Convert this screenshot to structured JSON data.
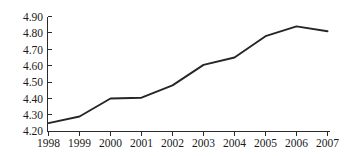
{
  "chart_data": {
    "type": "line",
    "title": "",
    "subtitle": "",
    "xlabel": "",
    "ylabel": "",
    "categories": [
      "1998",
      "1999",
      "2000",
      "2001",
      "2002",
      "2003",
      "2004",
      "2005",
      "2006",
      "2007"
    ],
    "x": [
      1998,
      1999,
      2000,
      2001,
      2002,
      2003,
      2004,
      2005,
      2006,
      2007
    ],
    "values": [
      4.25,
      4.29,
      4.4,
      4.405,
      4.48,
      4.605,
      4.65,
      4.78,
      4.84,
      4.81
    ],
    "series": [
      {
        "name": "series-1",
        "values": [
          4.25,
          4.29,
          4.4,
          4.405,
          4.48,
          4.605,
          4.65,
          4.78,
          4.84,
          4.81
        ],
        "color": "#262626"
      }
    ],
    "ylim": [
      4.2,
      4.9
    ],
    "xlim": [
      1998,
      2007
    ],
    "ytick_labels": [
      "4.90",
      "4.80",
      "4.70",
      "4.60",
      "4.50",
      "4.40",
      "4.30",
      "4.20"
    ],
    "ytick_values": [
      4.9,
      4.8,
      4.7,
      4.6,
      4.5,
      4.4,
      4.3,
      4.2
    ],
    "xtick_labels": [
      "1998",
      "1999",
      "2000",
      "2001",
      "2002",
      "2003",
      "2004",
      "2005",
      "2006",
      "2007"
    ],
    "grid": false,
    "legend": false,
    "legend_position": "none",
    "annotations": [],
    "line_color": "#262626",
    "axis_color": "#2b2b2b",
    "background_color": "#ffffff"
  }
}
